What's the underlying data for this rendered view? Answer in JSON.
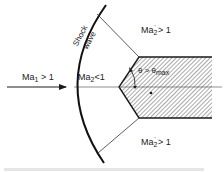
{
  "diagram": {
    "labels": {
      "upstream_mach": "Ma",
      "upstream_sub": "1",
      "upstream_cond": " > 1",
      "shock_word1": "Shock",
      "shock_word2": "wave",
      "behind_normal_mach": "Ma",
      "behind_normal_sub": "2",
      "behind_normal_cond": "<1",
      "upper_mach": "Ma",
      "upper_sub": "2",
      "upper_prime": "'",
      "upper_cond": " > 1",
      "lower_mach": "Ma",
      "lower_sub": "2",
      "lower_prime": "'",
      "lower_cond": " > 1",
      "angle_theta": "θ > θ",
      "angle_sub": "max"
    },
    "colors": {
      "ink": "#1a1a1a",
      "hatch": "#555555"
    },
    "caption": "Figure"
  }
}
